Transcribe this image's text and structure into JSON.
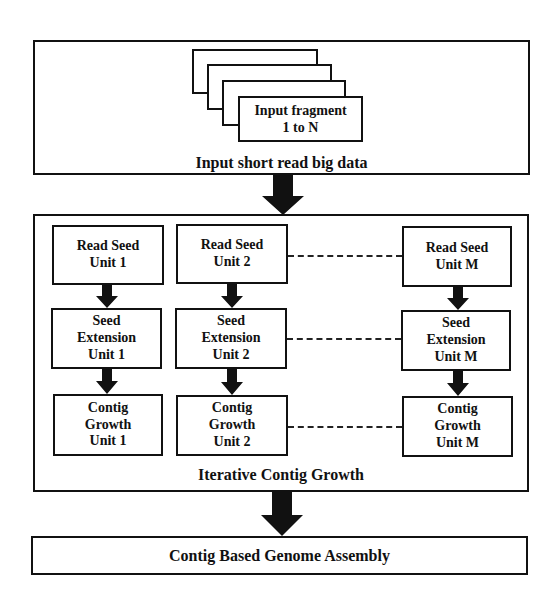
{
  "diagram": {
    "input_stage": {
      "label": "Input short read big data",
      "fragment_stack": {
        "front_card_line1": "Input fragment",
        "front_card_line2": "1 to N",
        "card_count": 4
      }
    },
    "iterative_stage": {
      "label": "Iterative Contig Growth",
      "columns": [
        {
          "read_seed": [
            "Read Seed",
            "Unit 1"
          ],
          "seed_extension": [
            "Seed",
            "Extension",
            "Unit 1"
          ],
          "contig_growth": [
            "Contig",
            "Growth",
            "Unit 1"
          ]
        },
        {
          "read_seed": [
            "Read Seed",
            "Unit 2"
          ],
          "seed_extension": [
            "Seed",
            "Extension",
            "Unit 2"
          ],
          "contig_growth": [
            "Contig",
            "Growth",
            "Unit 2"
          ]
        },
        {
          "read_seed": [
            "Read Seed",
            "Unit M"
          ],
          "seed_extension": [
            "Seed",
            "Extension",
            "Unit M"
          ],
          "contig_growth": [
            "Contig",
            "Growth",
            "Unit M"
          ]
        }
      ]
    },
    "output_stage": {
      "label": "Contig Based Genome Assembly"
    },
    "colors": {
      "stroke": "#111111",
      "background": "#ffffff"
    }
  }
}
